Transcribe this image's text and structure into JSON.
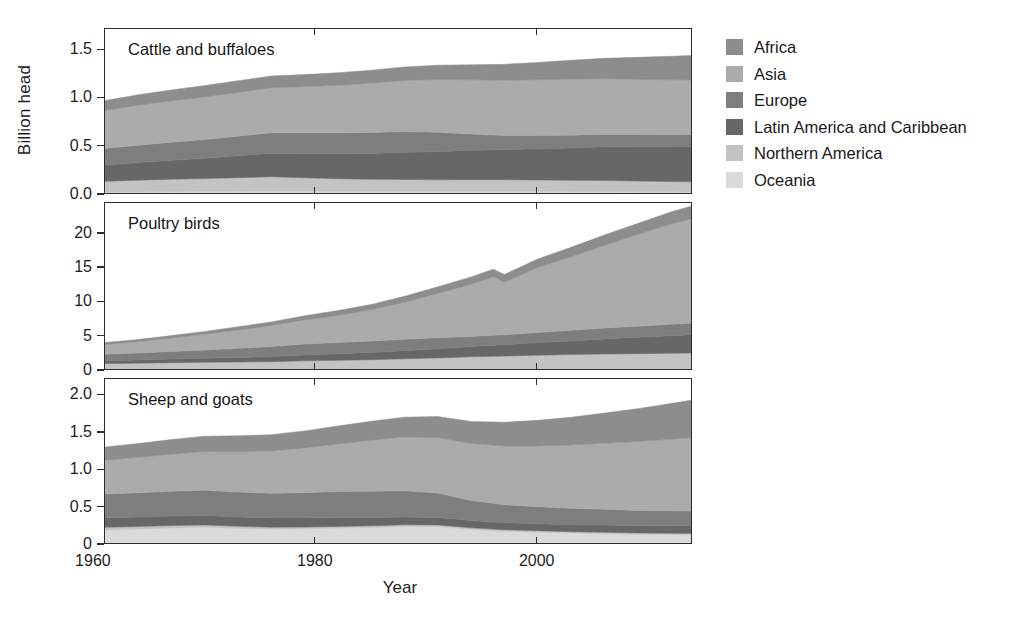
{
  "figure": {
    "ylabel": "Billion head",
    "xlabel": "Year"
  },
  "legend": {
    "position": "right",
    "items": [
      {
        "label": "Africa",
        "color": "#8d8d8d"
      },
      {
        "label": "Asia",
        "color": "#ababab"
      },
      {
        "label": "Europe",
        "color": "#7e7e7e"
      },
      {
        "label": "Latin America and Caribbean",
        "color": "#676767"
      },
      {
        "label": "Northern America",
        "color": "#c3c3c3"
      },
      {
        "label": "Oceania",
        "color": "#dadada"
      }
    ]
  },
  "chart_data": {
    "type": "area",
    "stacked": true,
    "title": "",
    "xlabel": "Year",
    "ylabel": "Billion head",
    "grid": false,
    "xlim": [
      1961,
      2014
    ],
    "xticks": [
      1960,
      1980,
      2000
    ],
    "xticklabels": [
      "1960",
      "1980",
      "2000"
    ],
    "series_order": [
      "Oceania",
      "Northern America",
      "Latin America and Caribbean",
      "Europe",
      "Asia",
      "Africa"
    ],
    "series_colors": {
      "Africa": "#8d8d8d",
      "Asia": "#ababab",
      "Europe": "#7e7e7e",
      "Latin America and Caribbean": "#676767",
      "Northern America": "#c3c3c3",
      "Oceania": "#dadada"
    },
    "panels": [
      {
        "title": "Cattle and buffaloes",
        "ylim": [
          0.0,
          1.72
        ],
        "yticks": [
          0.0,
          0.5,
          1.0,
          1.5
        ],
        "yticklabels": [
          "0.0",
          "0.5",
          "1.0",
          "1.5"
        ],
        "x": [
          1961,
          1964,
          1967,
          1970,
          1973,
          1976,
          1979,
          1982,
          1985,
          1988,
          1991,
          1994,
          1997,
          2000,
          2003,
          2006,
          2009,
          2012,
          2014
        ],
        "series": [
          {
            "name": "Oceania",
            "values": [
              0.03,
              0.032,
              0.035,
              0.038,
              0.04,
              0.041,
              0.04,
              0.039,
              0.039,
              0.039,
              0.039,
              0.038,
              0.038,
              0.038,
              0.037,
              0.036,
              0.034,
              0.033,
              0.032
            ]
          },
          {
            "name": "Northern America",
            "values": [
              0.112,
              0.122,
              0.128,
              0.132,
              0.14,
              0.148,
              0.138,
              0.13,
              0.124,
              0.122,
              0.118,
              0.121,
              0.12,
              0.118,
              0.115,
              0.114,
              0.11,
              0.106,
              0.104
            ]
          },
          {
            "name": "Latin America and Caribbean",
            "values": [
              0.168,
              0.182,
              0.196,
              0.21,
              0.226,
              0.244,
              0.25,
              0.258,
              0.268,
              0.282,
              0.292,
              0.304,
              0.312,
              0.322,
              0.336,
              0.35,
              0.356,
              0.362,
              0.368
            ]
          },
          {
            "name": "Europe",
            "values": [
              0.172,
              0.18,
              0.188,
              0.194,
              0.204,
              0.212,
              0.216,
              0.218,
              0.216,
              0.214,
              0.2,
              0.168,
              0.146,
              0.138,
              0.132,
              0.128,
              0.126,
              0.124,
              0.122
            ]
          },
          {
            "name": "Asia",
            "values": [
              0.396,
              0.414,
              0.428,
              0.442,
              0.452,
              0.466,
              0.478,
              0.492,
              0.512,
              0.53,
              0.548,
              0.562,
              0.572,
              0.578,
              0.58,
              0.576,
              0.572,
              0.568,
              0.566
            ]
          },
          {
            "name": "Africa",
            "values": [
              0.1,
              0.108,
              0.114,
              0.118,
              0.122,
              0.122,
              0.126,
              0.13,
              0.134,
              0.14,
              0.148,
              0.156,
              0.166,
              0.18,
              0.196,
              0.212,
              0.228,
              0.244,
              0.254
            ]
          }
        ],
        "totals": [
          0.978,
          1.038,
          1.089,
          1.134,
          1.184,
          1.233,
          1.248,
          1.267,
          1.293,
          1.327,
          1.345,
          1.349,
          1.354,
          1.374,
          1.396,
          1.416,
          1.426,
          1.437,
          1.446
        ]
      },
      {
        "title": "Poultry birds",
        "ylim": [
          0.0,
          24.5
        ],
        "yticks": [
          0,
          5,
          10,
          15,
          20
        ],
        "yticklabels": [
          "0",
          "5",
          "10",
          "15",
          "20"
        ],
        "x": [
          1961,
          1964,
          1967,
          1970,
          1973,
          1976,
          1979,
          1982,
          1985,
          1988,
          1991,
          1994,
          1996,
          1997,
          2000,
          2003,
          2006,
          2009,
          2012,
          2014
        ],
        "series": [
          {
            "name": "Oceania",
            "values": [
              0.03,
              0.04,
              0.04,
              0.05,
              0.05,
              0.06,
              0.06,
              0.07,
              0.07,
              0.08,
              0.09,
              0.1,
              0.11,
              0.11,
              0.12,
              0.13,
              0.14,
              0.15,
              0.16,
              0.17
            ]
          },
          {
            "name": "Northern America",
            "values": [
              1.05,
              1.1,
              1.18,
              1.22,
              1.26,
              1.3,
              1.42,
              1.48,
              1.58,
              1.7,
              1.82,
              1.96,
              2.04,
              2.06,
              2.18,
              2.26,
              2.34,
              2.38,
              2.42,
              2.46
            ]
          },
          {
            "name": "Latin America and Caribbean",
            "values": [
              0.42,
              0.46,
              0.52,
              0.58,
              0.66,
              0.74,
              0.86,
              0.96,
              1.06,
              1.18,
              1.32,
              1.5,
              1.62,
              1.66,
              1.84,
              2.0,
              2.2,
              2.38,
              2.56,
              2.66
            ]
          },
          {
            "name": "Europe",
            "values": [
              0.94,
              1.02,
              1.12,
              1.22,
              1.34,
              1.46,
              1.58,
              1.64,
              1.66,
              1.66,
              1.62,
              1.48,
              1.44,
              1.44,
              1.48,
              1.54,
              1.58,
              1.62,
              1.66,
              1.7
            ]
          },
          {
            "name": "Asia",
            "values": [
              1.42,
              1.66,
              1.94,
              2.28,
              2.66,
              3.06,
              3.52,
              3.96,
              4.56,
              5.42,
              6.46,
              7.62,
              8.52,
              7.66,
              9.46,
              10.72,
              12.06,
              13.36,
              14.62,
              15.3
            ]
          },
          {
            "name": "Africa",
            "values": [
              0.28,
              0.32,
              0.36,
              0.42,
              0.48,
              0.54,
              0.62,
              0.7,
              0.78,
              0.86,
              0.96,
              1.06,
              1.12,
              1.14,
              1.26,
              1.38,
              1.5,
              1.62,
              1.76,
              1.84
            ]
          }
        ],
        "totals": [
          4.14,
          4.6,
          5.16,
          5.77,
          6.45,
          7.16,
          8.06,
          8.81,
          9.71,
          10.9,
          12.27,
          13.72,
          14.85,
          14.07,
          16.34,
          18.03,
          19.82,
          21.51,
          23.18,
          24.13
        ]
      },
      {
        "title": "Sheep and goats",
        "ylim": [
          0.0,
          2.22
        ],
        "yticks": [
          0,
          0.5,
          1.0,
          1.5,
          2.0
        ],
        "yticklabels": [
          "0",
          "0.5",
          "1.0",
          "1.5",
          "2.0"
        ],
        "x": [
          1961,
          1964,
          1967,
          1970,
          1973,
          1976,
          1979,
          1982,
          1985,
          1988,
          1991,
          1994,
          1997,
          2000,
          2003,
          2006,
          2009,
          2012,
          2014
        ],
        "series": [
          {
            "name": "Oceania",
            "values": [
              0.2,
              0.212,
              0.228,
              0.238,
              0.222,
              0.212,
              0.216,
              0.226,
              0.234,
              0.248,
              0.246,
              0.208,
              0.184,
              0.172,
              0.16,
              0.152,
              0.144,
              0.14,
              0.138
            ]
          },
          {
            "name": "Northern America",
            "values": [
              0.038,
              0.036,
              0.032,
              0.03,
              0.028,
              0.026,
              0.024,
              0.023,
              0.022,
              0.022,
              0.022,
              0.022,
              0.02,
              0.019,
              0.018,
              0.018,
              0.017,
              0.017,
              0.017
            ]
          },
          {
            "name": "Latin America and Caribbean",
            "values": [
              0.124,
              0.126,
              0.128,
              0.128,
              0.126,
              0.124,
              0.122,
              0.118,
              0.112,
              0.106,
              0.1,
              0.096,
              0.094,
              0.094,
              0.094,
              0.096,
              0.098,
              0.1,
              0.102
            ]
          },
          {
            "name": "Europe",
            "values": [
              0.32,
              0.324,
              0.33,
              0.336,
              0.332,
              0.33,
              0.338,
              0.348,
              0.352,
              0.348,
              0.326,
              0.268,
              0.24,
              0.228,
              0.218,
              0.212,
              0.204,
              0.198,
              0.196
            ]
          },
          {
            "name": "Asia",
            "values": [
              0.452,
              0.474,
              0.496,
              0.518,
              0.54,
              0.566,
              0.598,
              0.636,
              0.682,
              0.72,
              0.742,
              0.762,
              0.786,
              0.812,
              0.846,
              0.882,
              0.92,
              0.958,
              0.982
            ]
          },
          {
            "name": "Africa",
            "values": [
              0.176,
              0.186,
              0.196,
              0.206,
              0.212,
              0.218,
              0.228,
              0.24,
              0.252,
              0.266,
              0.282,
              0.296,
              0.318,
              0.342,
              0.372,
              0.404,
              0.44,
              0.478,
              0.506
            ]
          }
        ],
        "totals": [
          1.31,
          1.358,
          1.41,
          1.456,
          1.46,
          1.476,
          1.526,
          1.591,
          1.654,
          1.71,
          1.718,
          1.652,
          1.642,
          1.667,
          1.708,
          1.764,
          1.823,
          1.891,
          1.941
        ]
      }
    ]
  }
}
